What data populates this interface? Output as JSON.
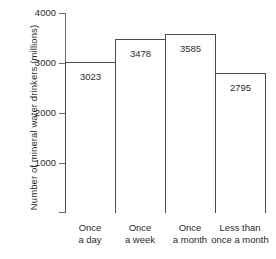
{
  "chart_data": {
    "type": "bar",
    "title": "",
    "xlabel": "",
    "ylabel": "Number of mineral water drinkers (millions)",
    "categories": [
      "Once a day",
      "Once a week",
      "Once a month",
      "Less than once a month"
    ],
    "category_lines": [
      [
        "Once",
        "a day"
      ],
      [
        "Once",
        "a week"
      ],
      [
        "Once",
        "a month"
      ],
      [
        "Less than",
        "once a month"
      ]
    ],
    "values": [
      3023,
      3478,
      3585,
      2795
    ],
    "value_labels": [
      "3023",
      "3478",
      "3585",
      "2795"
    ],
    "ylim": [
      0,
      4000
    ],
    "yticks": [
      1000,
      2000,
      3000,
      4000
    ],
    "ytick_labels": [
      "1000",
      "2000",
      "3000",
      "4000"
    ],
    "grid": false,
    "legend": false,
    "bar_fill_color": "#ffffff",
    "bar_border_color": "#4d4d4d",
    "axis_color": "#6e6e6e",
    "background_color": "#ffffff"
  }
}
